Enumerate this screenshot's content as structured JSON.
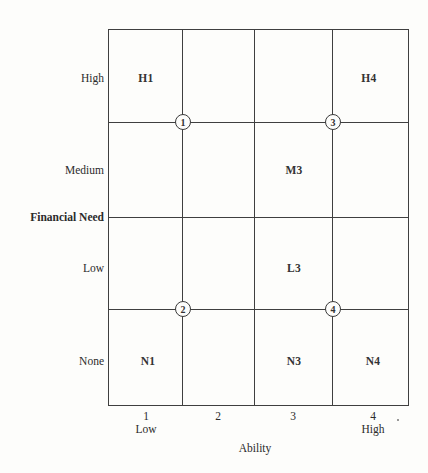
{
  "diagram": {
    "y_axis": {
      "title": "Financial Need",
      "rows": [
        {
          "label": "High"
        },
        {
          "label": "Medium"
        },
        {
          "label": "Low"
        },
        {
          "label": "None"
        }
      ]
    },
    "x_axis": {
      "title": "Ability",
      "columns": [
        {
          "number": "1",
          "sublabel": "Low"
        },
        {
          "number": "2",
          "sublabel": ""
        },
        {
          "number": "3",
          "sublabel": ""
        },
        {
          "number": "4",
          "sublabel": "High"
        }
      ]
    },
    "cells": {
      "H1": "H1",
      "H4": "H4",
      "M3": "M3",
      "L3": "L3",
      "N1": "N1",
      "N3": "N3",
      "N4": "N4"
    },
    "nodes": {
      "n1": "1",
      "n2": "2",
      "n3": "3",
      "n4": "4"
    },
    "colors": {
      "line": "#3f3f3f",
      "text": "#2b2b2b",
      "background": "#fdfdfb"
    }
  }
}
